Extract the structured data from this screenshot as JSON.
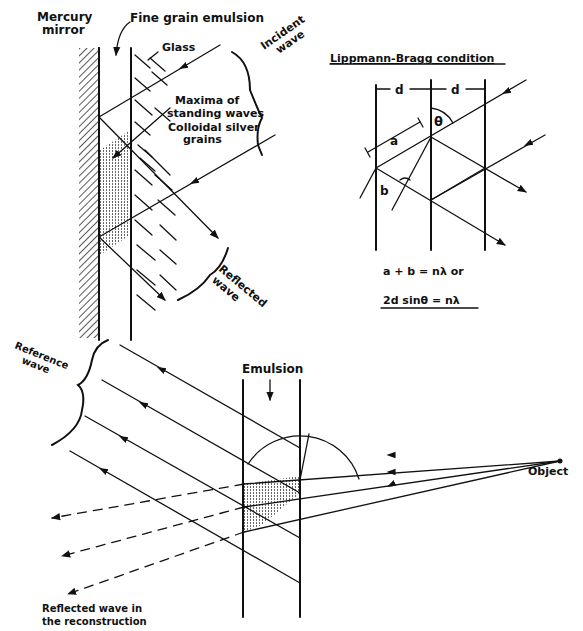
{
  "top_left_panel": {
    "labels": {
      "mercury_mirror_line1": "Mercury",
      "mercury_mirror_line2": "mirror",
      "fine_grain_emulsion": "Fine grain emulsion",
      "glass": "Glass",
      "incident_wave_line1": "Incident",
      "incident_wave_line2": "wave",
      "maxima_line1": "Maxima of",
      "maxima_line2": "standing waves",
      "colloidal_line1": "Colloidal silver",
      "colloidal_line2": "grains",
      "reflected_wave_line1": "Reflected",
      "reflected_wave_line2": "wave"
    }
  },
  "top_right_panel": {
    "title": "Lippmann-Bragg condition",
    "spacing_label_1": "d",
    "spacing_label_2": "d",
    "angle_label": "θ",
    "segment_a": "a",
    "segment_b": "b",
    "equation_1": "a + b = nλ   or",
    "equation_2": "2d sinθ = nλ"
  },
  "bottom_panel": {
    "labels": {
      "reference_wave_line1": "Reference",
      "reference_wave_line2": "wave",
      "emulsion": "Emulsion",
      "object": "Object",
      "reflected_reconstruction_line1": "Reflected wave in",
      "reflected_reconstruction_line2": "the reconstruction"
    }
  },
  "colors": {
    "ink": "#111111",
    "background": "#ffffff"
  }
}
